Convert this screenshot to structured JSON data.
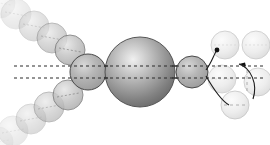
{
  "figure": {
    "canvas": {
      "width": 270,
      "height": 145,
      "background": "#ffffff"
    },
    "colors": {
      "core_dark": "#6f6f6f",
      "core_mid": "#9a9a9a",
      "core_light": "#d8d8d8",
      "core_highlight": "#ececec",
      "outline": "#4a4a4a",
      "outline_faint": "#c9c9c9",
      "dash_line": "#2b2b2b",
      "arrow": "#1d1d1d",
      "sphere_mid": "#b4b4b4",
      "sphere_pale": "#f2f2f2"
    }
  },
  "core": {
    "label": "central-sphere",
    "cx": 140,
    "cy": 72,
    "r": 35,
    "fill_center": "#ededed",
    "fill_edge": "#737373",
    "stroke": "#555555"
  },
  "axis_lines": [
    {
      "name": "axis-upper",
      "x1": 14,
      "y1": 66,
      "x2": 262,
      "y2": 66,
      "dash": "3,3"
    },
    {
      "name": "axis-lower",
      "x1": 14,
      "y1": 78,
      "x2": 262,
      "y2": 78,
      "dash": "3,3"
    }
  ],
  "flank_spheres": [
    {
      "name": "flank-left",
      "cx": 88,
      "cy": 72,
      "r": 18,
      "fill": "#b0b0b0",
      "stroke": "#4a4a4a",
      "opacity": 1
    },
    {
      "name": "flank-right",
      "cx": 192,
      "cy": 72,
      "r": 16,
      "fill": "#b4b4b4",
      "stroke": "#4a4a4a",
      "opacity": 1
    }
  ],
  "chain_upper": {
    "name": "upper-left-chain",
    "spheres": [
      {
        "cx": 70,
        "cy": 50,
        "r": 15,
        "opacity": 0.82
      },
      {
        "cx": 52,
        "cy": 38,
        "r": 15,
        "opacity": 0.62
      },
      {
        "cx": 34,
        "cy": 26,
        "r": 15,
        "opacity": 0.44
      },
      {
        "cx": 16,
        "cy": 14,
        "r": 15,
        "opacity": 0.28
      },
      {
        "cx": 0,
        "cy": 3,
        "r": 15,
        "opacity": 0.16
      }
    ]
  },
  "chain_lower": {
    "name": "lower-left-chain",
    "spheres": [
      {
        "cx": 68,
        "cy": 95,
        "r": 15,
        "opacity": 0.8
      },
      {
        "cx": 49,
        "cy": 107,
        "r": 15,
        "opacity": 0.6
      },
      {
        "cx": 31,
        "cy": 119,
        "r": 15,
        "opacity": 0.42
      },
      {
        "cx": 13,
        "cy": 131,
        "r": 15,
        "opacity": 0.26
      },
      {
        "cx": -2,
        "cy": 142,
        "r": 15,
        "opacity": 0.15
      }
    ]
  },
  "scatter_spheres": [
    {
      "name": "scatter-top-left",
      "cx": 225,
      "cy": 45,
      "r": 14,
      "opacity": 0.3
    },
    {
      "name": "scatter-top-right",
      "cx": 256,
      "cy": 45,
      "r": 14,
      "opacity": 0.3
    },
    {
      "name": "scatter-mid-left",
      "cx": 222,
      "cy": 79,
      "r": 14,
      "opacity": 0.26
    },
    {
      "name": "scatter-mid-right",
      "cx": 258,
      "cy": 82,
      "r": 14,
      "opacity": 0.26
    },
    {
      "name": "scatter-bottom",
      "cx": 235,
      "cy": 105,
      "r": 14,
      "opacity": 0.3
    }
  ],
  "scatter_dashes": [
    {
      "name": "scatter-dash-right",
      "x1": 246,
      "y1": 70,
      "x2": 246,
      "y2": 94,
      "dash": "3,3"
    },
    {
      "name": "scatter-dash-bottom",
      "x1": 224,
      "y1": 105,
      "x2": 246,
      "y2": 105,
      "dash": "3,3"
    }
  ],
  "arrows": [
    {
      "name": "arrow-upper-scatter",
      "path": "M 206 70 C 212 62 214 54 217 50",
      "head_x": 217,
      "head_y": 50,
      "head_angle": -58
    },
    {
      "name": "arrow-lower-scatter",
      "path": "M 206 76 C 214 90 222 102 228 105",
      "head_x": 228,
      "head_y": 105,
      "head_angle": 30
    },
    {
      "name": "arrow-recirculate",
      "path": "M 252 98 C 256 84 250 68 238 64",
      "head_x": 238,
      "head_y": 64,
      "head_angle": 192
    }
  ],
  "internal_dashes": {
    "name": "sphere-internal-dashes",
    "dash": "2,2",
    "stroke": "#8a8a8a"
  }
}
